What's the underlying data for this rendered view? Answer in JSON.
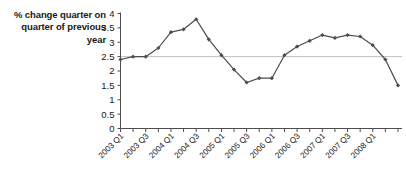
{
  "chart_data": {
    "type": "line",
    "title": "% change quarter on quarter of previous year",
    "xlabel": "",
    "ylabel": "% change quarter on quarter of previous year",
    "ylim": [
      0,
      4
    ],
    "ytick_step": 0.5,
    "yticks": [
      "0",
      "0.5",
      "1",
      "1.5",
      "2",
      "2.5",
      "3",
      "3.5",
      "4"
    ],
    "grid": false,
    "legend": "none",
    "reference_line": {
      "value": 2.5,
      "orientation": "horizontal",
      "color": "#bfbfbf"
    },
    "series_color": "#4d4d4d",
    "marker": "diamond",
    "categories": [
      "2003 Q1",
      "2003 Q2",
      "2003 Q3",
      "2003 Q4",
      "2004 Q1",
      "2004 Q2",
      "2004 Q3",
      "2004 Q4",
      "2005 Q1",
      "2005 Q2",
      "2005 Q3",
      "2005 Q4",
      "2006 Q1",
      "2006 Q2",
      "2006 Q3",
      "2006 Q4",
      "2007 Q1",
      "2007 Q2",
      "2007 Q3",
      "2007 Q4",
      "2008 Q1",
      "2008 Q2",
      "2008 Q3"
    ],
    "xtick_labels": [
      "2003 Q1",
      "2003 Q3",
      "2004 Q1",
      "2004 Q3",
      "2005 Q1",
      "2005 Q3",
      "2006 Q1",
      "2006 Q3",
      "2007 Q1",
      "2007 Q3",
      "2008 Q1"
    ],
    "values": [
      2.4,
      2.5,
      2.5,
      2.8,
      3.35,
      3.45,
      3.8,
      3.1,
      2.55,
      2.05,
      1.6,
      1.75,
      1.75,
      2.55,
      2.85,
      3.05,
      3.25,
      3.15,
      3.25,
      3.2,
      2.9,
      2.4,
      1.5
    ]
  }
}
